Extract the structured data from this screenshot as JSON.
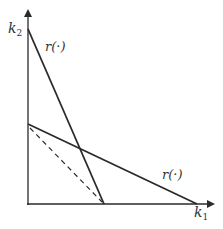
{
  "diagram": {
    "axes": {
      "x_label": "k",
      "x_sub": "1",
      "y_label": "k",
      "y_sub": "2"
    },
    "curves": [
      {
        "name": "steep-reaction-line",
        "label": "r(·)",
        "style": "solid"
      },
      {
        "name": "flat-reaction-line",
        "label": "r(·)",
        "style": "solid"
      },
      {
        "name": "dashed-line",
        "label": "",
        "style": "dashed"
      }
    ],
    "colors": {
      "ink": "#2a2a2a",
      "background": "#ffffff"
    }
  }
}
